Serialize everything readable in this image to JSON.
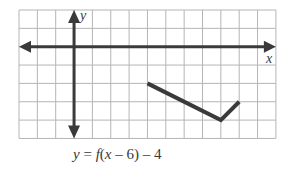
{
  "chart_data": {
    "type": "line",
    "title": "",
    "caption": "y = f(x − 6) − 4",
    "xlabel": "x",
    "ylabel": "y",
    "xlim": [
      -3,
      11
    ],
    "ylim": [
      -5,
      2
    ],
    "grid": true,
    "grid_step": 1,
    "tick_labels": false,
    "series": [
      {
        "name": "y = f(x − 6) − 4",
        "points": [
          [
            4,
            -2
          ],
          [
            8,
            -4
          ],
          [
            9,
            -3
          ]
        ]
      }
    ]
  },
  "labels": {
    "x_axis": "x",
    "y_axis": "y",
    "caption_y": "y",
    "caption_eq": " = ",
    "caption_f": "f",
    "caption_rest_1": "(",
    "caption_x": "x",
    "caption_rest_2": " – 6) – 4"
  },
  "colors": {
    "grid": "#b5b5b5",
    "axes": "#3a3a3a",
    "curve": "#3a3a3a",
    "background": "#ffffff"
  }
}
